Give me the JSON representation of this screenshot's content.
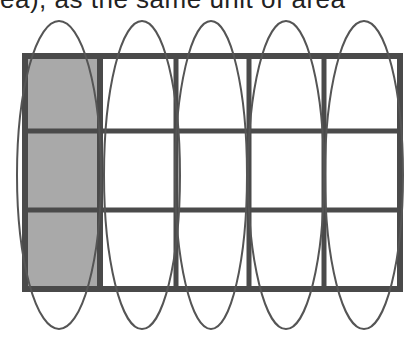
{
  "caption_fragment": "ea), as the same unit of area",
  "diagram": {
    "type": "area-grid",
    "grid": {
      "rows": 3,
      "cols": 5,
      "x": 22,
      "y": 54,
      "col_edges": [
        22,
        100,
        176,
        249,
        324,
        402
      ],
      "row_edges": [
        54,
        131,
        210,
        291
      ]
    },
    "shaded_column_index": 0,
    "ellipse_count": 5,
    "colors": {
      "grid_line": "#4a4a4a",
      "shade": "#a9a9a9",
      "ellipse": "#555555",
      "background": "#ffffff"
    }
  }
}
